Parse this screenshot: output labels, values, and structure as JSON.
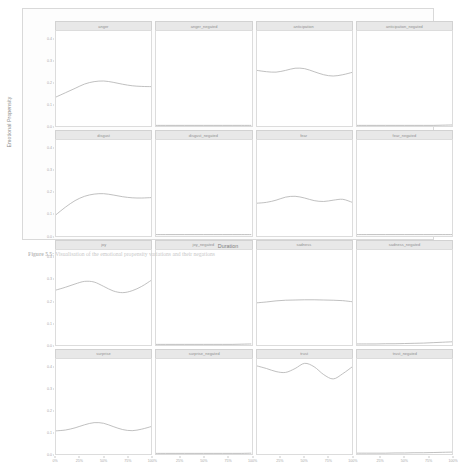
{
  "figure": {
    "caption_label": "Figure 5.5:",
    "caption_text": "Visualisation of the emotional propensity variations and their negations",
    "xlabel": "Duration",
    "ylabel": "Emotional Propensity"
  },
  "axes": {
    "y_ticks": [
      "0.0",
      "0.1",
      "0.2",
      "0.3",
      "0.4"
    ],
    "y_values": [
      0.0,
      0.1,
      0.2,
      0.3,
      0.4
    ],
    "x_ticks": [
      "0%",
      "25%",
      "50%",
      "75%",
      "100%"
    ],
    "x_values": [
      0,
      25,
      50,
      75,
      100
    ],
    "ylim": [
      0.0,
      0.44
    ],
    "xlim": [
      0,
      100
    ]
  },
  "chart_data": {
    "type": "line",
    "title": "",
    "subtitle": "",
    "xlabel": "Duration",
    "ylabel": "Emotional Propensity",
    "xlim": [
      0,
      100
    ],
    "ylim": [
      0.0,
      0.44
    ],
    "grid": false,
    "legend": "none",
    "layout": {
      "rows": 4,
      "cols": 4,
      "facet": "emotion"
    },
    "x": [
      0,
      10,
      20,
      30,
      40,
      50,
      60,
      70,
      80,
      90,
      100
    ],
    "series": [
      {
        "name": "anger",
        "row": 1,
        "col": 1,
        "values": [
          0.135,
          0.155,
          0.175,
          0.195,
          0.206,
          0.209,
          0.203,
          0.194,
          0.187,
          0.184,
          0.183
        ]
      },
      {
        "name": "anger_negated",
        "row": 1,
        "col": 2,
        "values": [
          0.004,
          0.004,
          0.004,
          0.004,
          0.004,
          0.004,
          0.004,
          0.004,
          0.004,
          0.004,
          0.004
        ]
      },
      {
        "name": "anticipation",
        "row": 1,
        "col": 3,
        "values": [
          0.258,
          0.252,
          0.25,
          0.258,
          0.268,
          0.266,
          0.252,
          0.238,
          0.232,
          0.238,
          0.249
        ]
      },
      {
        "name": "anticipation_negated",
        "row": 1,
        "col": 4,
        "values": [
          0.004,
          0.004,
          0.004,
          0.004,
          0.004,
          0.004,
          0.004,
          0.004,
          0.004,
          0.005,
          0.006
        ]
      },
      {
        "name": "disgust",
        "row": 2,
        "col": 1,
        "values": [
          0.095,
          0.13,
          0.16,
          0.18,
          0.19,
          0.192,
          0.186,
          0.178,
          0.173,
          0.172,
          0.174
        ]
      },
      {
        "name": "disgust_negated",
        "row": 2,
        "col": 2,
        "values": [
          0.003,
          0.003,
          0.003,
          0.003,
          0.003,
          0.003,
          0.003,
          0.003,
          0.003,
          0.003,
          0.003
        ]
      },
      {
        "name": "fear",
        "row": 2,
        "col": 3,
        "values": [
          0.148,
          0.152,
          0.162,
          0.176,
          0.18,
          0.172,
          0.16,
          0.156,
          0.162,
          0.166,
          0.152
        ]
      },
      {
        "name": "fear_negated",
        "row": 2,
        "col": 4,
        "values": [
          0.003,
          0.003,
          0.003,
          0.003,
          0.003,
          0.003,
          0.003,
          0.003,
          0.003,
          0.003,
          0.003
        ]
      },
      {
        "name": "joy",
        "row": 3,
        "col": 1,
        "values": [
          0.255,
          0.268,
          0.283,
          0.295,
          0.292,
          0.272,
          0.251,
          0.243,
          0.252,
          0.272,
          0.3
        ]
      },
      {
        "name": "joy_negated",
        "row": 3,
        "col": 2,
        "values": [
          0.004,
          0.004,
          0.004,
          0.004,
          0.004,
          0.004,
          0.004,
          0.004,
          0.004,
          0.005,
          0.006
        ]
      },
      {
        "name": "sadness",
        "row": 3,
        "col": 3,
        "values": [
          0.196,
          0.2,
          0.205,
          0.208,
          0.209,
          0.21,
          0.21,
          0.209,
          0.208,
          0.206,
          0.201
        ]
      },
      {
        "name": "sadness_negated",
        "row": 3,
        "col": 4,
        "values": [
          0.006,
          0.006,
          0.006,
          0.007,
          0.007,
          0.008,
          0.009,
          0.01,
          0.012,
          0.014,
          0.016
        ]
      },
      {
        "name": "surprise",
        "row": 4,
        "col": 1,
        "values": [
          0.108,
          0.112,
          0.122,
          0.136,
          0.146,
          0.143,
          0.128,
          0.114,
          0.109,
          0.116,
          0.128
        ]
      },
      {
        "name": "surprise_negated",
        "row": 4,
        "col": 2,
        "values": [
          0.004,
          0.004,
          0.004,
          0.004,
          0.004,
          0.004,
          0.004,
          0.004,
          0.004,
          0.004,
          0.005
        ]
      },
      {
        "name": "trust",
        "row": 4,
        "col": 3,
        "values": [
          0.408,
          0.396,
          0.382,
          0.378,
          0.396,
          0.42,
          0.404,
          0.368,
          0.348,
          0.372,
          0.404
        ]
      },
      {
        "name": "trust_negated",
        "row": 4,
        "col": 4,
        "values": [
          0.005,
          0.005,
          0.005,
          0.005,
          0.006,
          0.006,
          0.007,
          0.007,
          0.008,
          0.009,
          0.01
        ]
      }
    ]
  },
  "colors": {
    "line": "#b0b0b0",
    "strip_bg": "#e8e8e8",
    "panel_border": "#dcdcdc",
    "tick_text": "#a8a8a8",
    "axis_title": "#7d7d7d"
  }
}
